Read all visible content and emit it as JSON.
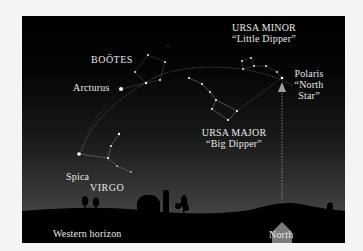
{
  "diagram": {
    "colors": {
      "page_background": "#f4f4f4",
      "sky_top": "#000000",
      "sky_horizon": "#454545",
      "ground": "#000000",
      "stars": "#ffffff",
      "labels": "#e8e8e8",
      "north_arrow": "#7a7a7a"
    },
    "constellations": {
      "ursa_minor": {
        "name": "URSA MINOR",
        "nickname": "“Little Dipper”"
      },
      "bootes": {
        "name": "BOÖTES"
      },
      "ursa_major": {
        "name": "URSA MAJOR",
        "nickname": "“Big Dipper”"
      },
      "virgo": {
        "name": "VIRGO"
      }
    },
    "stars": {
      "arcturus": "Arcturus",
      "spica": "Spica",
      "polaris": {
        "line1": "Polaris",
        "line2": "“North",
        "line3": "Star”"
      }
    },
    "horizon": {
      "western": "Western horizon",
      "north": "North"
    },
    "icons": {
      "north_arrow": "up-arrow-icon",
      "barn": "barn-silhouette",
      "silo": "silo-silhouette",
      "trees": "tree-silhouette"
    }
  }
}
